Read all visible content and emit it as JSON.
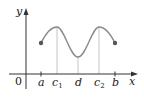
{
  "diagram": {
    "type": "function-graph",
    "axes": {
      "x_label": "x",
      "y_label": "y",
      "origin_label": "0"
    },
    "x_ticks": [
      {
        "id": "a",
        "label": "a",
        "sub": ""
      },
      {
        "id": "c1",
        "label": "c",
        "sub": "1"
      },
      {
        "id": "d",
        "label": "d",
        "sub": ""
      },
      {
        "id": "c2",
        "label": "c",
        "sub": "2"
      },
      {
        "id": "b",
        "label": "b",
        "sub": ""
      }
    ],
    "curve": {
      "description": "Smooth curve on [a,b] with local maxima at c1 and c2 and a local minimum at d; closed endpoints at a and b",
      "color": "#888888",
      "endpoint_color": "#555555"
    },
    "guide_line_color": "#bbbbbb",
    "axis_color": "#333333"
  }
}
